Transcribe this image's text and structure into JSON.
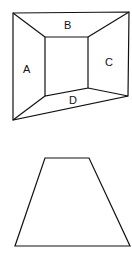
{
  "figure_top": {
    "description": "Room-like perspective figure with four labeled trapezoidal regions",
    "labels": {
      "top": "B",
      "left": "A",
      "right": "C",
      "bottom": "D"
    }
  },
  "figure_bottom": {
    "description": "Isolated trapezoid shape"
  },
  "colors": {
    "stroke": "#111111",
    "background": "#ffffff"
  }
}
